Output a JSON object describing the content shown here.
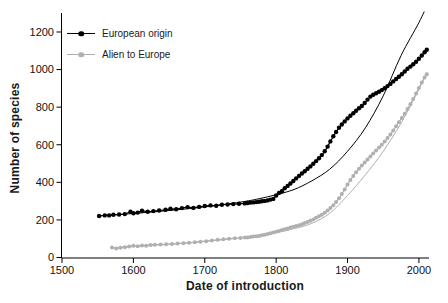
{
  "figure": {
    "background": "#ffffff",
    "text_color": "#1a1a1a"
  },
  "chart_data": {
    "type": "line",
    "title": "",
    "xlabel": "Date of introduction",
    "ylabel": "Number of species",
    "xlim": [
      1500,
      2012
    ],
    "ylim": [
      0,
      1300
    ],
    "x_ticks": [
      1500,
      1600,
      1700,
      1800,
      1900,
      2000
    ],
    "y_ticks": [
      0,
      200,
      400,
      600,
      800,
      1000,
      1200
    ],
    "grid": false,
    "legend_position": "top-left",
    "axis_color": "#000000",
    "series": [
      {
        "name": "European origin",
        "color": "#000000",
        "marker": "circle",
        "points": [
          [
            1552,
            221
          ],
          [
            1560,
            224
          ],
          [
            1566,
            224
          ],
          [
            1572,
            227
          ],
          [
            1580,
            229
          ],
          [
            1588,
            231
          ],
          [
            1596,
            243
          ],
          [
            1600,
            236
          ],
          [
            1606,
            239
          ],
          [
            1612,
            249
          ],
          [
            1620,
            243
          ],
          [
            1628,
            247
          ],
          [
            1636,
            250
          ],
          [
            1645,
            254
          ],
          [
            1652,
            259
          ],
          [
            1660,
            257
          ],
          [
            1668,
            263
          ],
          [
            1676,
            268
          ],
          [
            1684,
            264
          ],
          [
            1692,
            269
          ],
          [
            1700,
            274
          ],
          [
            1708,
            277
          ],
          [
            1716,
            275
          ],
          [
            1724,
            281
          ],
          [
            1732,
            282
          ],
          [
            1740,
            284
          ],
          [
            1748,
            286
          ],
          [
            1756,
            288
          ],
          [
            1760,
            290
          ],
          [
            1764,
            292
          ],
          [
            1768,
            293
          ],
          [
            1772,
            295
          ],
          [
            1776,
            297
          ],
          [
            1780,
            299
          ],
          [
            1784,
            301
          ],
          [
            1788,
            304
          ],
          [
            1792,
            308
          ],
          [
            1796,
            312
          ],
          [
            1800,
            330
          ],
          [
            1804,
            344
          ],
          [
            1808,
            353
          ],
          [
            1812,
            369
          ],
          [
            1816,
            381
          ],
          [
            1820,
            394
          ],
          [
            1824,
            407
          ],
          [
            1828,
            421
          ],
          [
            1832,
            434
          ],
          [
            1836,
            447
          ],
          [
            1840,
            459
          ],
          [
            1844,
            472
          ],
          [
            1848,
            485
          ],
          [
            1852,
            499
          ],
          [
            1856,
            513
          ],
          [
            1860,
            528
          ],
          [
            1864,
            545
          ],
          [
            1868,
            565
          ],
          [
            1872,
            590
          ],
          [
            1876,
            618
          ],
          [
            1880,
            645
          ],
          [
            1884,
            668
          ],
          [
            1888,
            690
          ],
          [
            1892,
            708
          ],
          [
            1896,
            724
          ],
          [
            1900,
            740
          ],
          [
            1904,
            754
          ],
          [
            1908,
            768
          ],
          [
            1912,
            781
          ],
          [
            1916,
            794
          ],
          [
            1920,
            806
          ],
          [
            1924,
            822
          ],
          [
            1928,
            840
          ],
          [
            1932,
            856
          ],
          [
            1936,
            866
          ],
          [
            1940,
            874
          ],
          [
            1944,
            882
          ],
          [
            1948,
            891
          ],
          [
            1952,
            901
          ],
          [
            1956,
            912
          ],
          [
            1960,
            924
          ],
          [
            1964,
            937
          ],
          [
            1968,
            950
          ],
          [
            1972,
            962
          ],
          [
            1976,
            975
          ],
          [
            1980,
            990
          ],
          [
            1984,
            1004
          ],
          [
            1988,
            1016
          ],
          [
            1992,
            1028
          ],
          [
            1996,
            1042
          ],
          [
            2000,
            1058
          ],
          [
            2004,
            1075
          ],
          [
            2008,
            1092
          ],
          [
            2011,
            1105
          ]
        ],
        "trend": [
          [
            1552,
            222
          ],
          [
            1600,
            234
          ],
          [
            1650,
            250
          ],
          [
            1700,
            269
          ],
          [
            1750,
            295
          ],
          [
            1775,
            312
          ],
          [
            1800,
            334
          ],
          [
            1825,
            362
          ],
          [
            1850,
            408
          ],
          [
            1875,
            470
          ],
          [
            1900,
            565
          ],
          [
            1925,
            690
          ],
          [
            1950,
            860
          ],
          [
            1975,
            1075
          ],
          [
            2000,
            1250
          ],
          [
            2011,
            1340
          ]
        ]
      },
      {
        "name": "Alien to Europe",
        "color": "#b0b0b0",
        "marker": "circle",
        "points": [
          [
            1570,
            54
          ],
          [
            1576,
            48
          ],
          [
            1582,
            52
          ],
          [
            1588,
            55
          ],
          [
            1594,
            58
          ],
          [
            1600,
            62
          ],
          [
            1606,
            60
          ],
          [
            1612,
            64
          ],
          [
            1618,
            63
          ],
          [
            1624,
            67
          ],
          [
            1630,
            68
          ],
          [
            1638,
            69
          ],
          [
            1646,
            71
          ],
          [
            1654,
            72
          ],
          [
            1662,
            74
          ],
          [
            1670,
            76
          ],
          [
            1678,
            78
          ],
          [
            1686,
            81
          ],
          [
            1694,
            84
          ],
          [
            1702,
            87
          ],
          [
            1710,
            90
          ],
          [
            1718,
            94
          ],
          [
            1726,
            97
          ],
          [
            1734,
            100
          ],
          [
            1742,
            102
          ],
          [
            1750,
            104
          ],
          [
            1756,
            106
          ],
          [
            1760,
            107
          ],
          [
            1764,
            109
          ],
          [
            1768,
            111
          ],
          [
            1772,
            113
          ],
          [
            1776,
            115
          ],
          [
            1780,
            118
          ],
          [
            1784,
            121
          ],
          [
            1788,
            125
          ],
          [
            1792,
            129
          ],
          [
            1796,
            133
          ],
          [
            1800,
            137
          ],
          [
            1804,
            141
          ],
          [
            1808,
            146
          ],
          [
            1812,
            150
          ],
          [
            1816,
            155
          ],
          [
            1820,
            159
          ],
          [
            1824,
            164
          ],
          [
            1828,
            168
          ],
          [
            1832,
            172
          ],
          [
            1836,
            177
          ],
          [
            1840,
            183
          ],
          [
            1844,
            189
          ],
          [
            1848,
            196
          ],
          [
            1852,
            203
          ],
          [
            1856,
            211
          ],
          [
            1860,
            219
          ],
          [
            1864,
            228
          ],
          [
            1868,
            238
          ],
          [
            1872,
            250
          ],
          [
            1876,
            263
          ],
          [
            1880,
            278
          ],
          [
            1884,
            295
          ],
          [
            1888,
            315
          ],
          [
            1892,
            338
          ],
          [
            1896,
            362
          ],
          [
            1900,
            388
          ],
          [
            1904,
            412
          ],
          [
            1908,
            434
          ],
          [
            1912,
            454
          ],
          [
            1916,
            472
          ],
          [
            1920,
            489
          ],
          [
            1924,
            505
          ],
          [
            1928,
            522
          ],
          [
            1932,
            538
          ],
          [
            1936,
            554
          ],
          [
            1940,
            570
          ],
          [
            1944,
            585
          ],
          [
            1948,
            600
          ],
          [
            1952,
            617
          ],
          [
            1956,
            636
          ],
          [
            1960,
            655
          ],
          [
            1964,
            676
          ],
          [
            1968,
            698
          ],
          [
            1972,
            720
          ],
          [
            1976,
            742
          ],
          [
            1980,
            765
          ],
          [
            1984,
            790
          ],
          [
            1988,
            816
          ],
          [
            1992,
            843
          ],
          [
            1996,
            872
          ],
          [
            2000,
            902
          ],
          [
            2004,
            932
          ],
          [
            2008,
            958
          ],
          [
            2011,
            975
          ]
        ],
        "trend": [
          [
            1570,
            50
          ],
          [
            1600,
            58
          ],
          [
            1650,
            70
          ],
          [
            1700,
            86
          ],
          [
            1750,
            105
          ],
          [
            1800,
            133
          ],
          [
            1825,
            153
          ],
          [
            1850,
            182
          ],
          [
            1875,
            235
          ],
          [
            1900,
            330
          ],
          [
            1925,
            440
          ],
          [
            1950,
            565
          ],
          [
            1975,
            715
          ],
          [
            2000,
            895
          ],
          [
            2011,
            985
          ]
        ]
      }
    ]
  }
}
